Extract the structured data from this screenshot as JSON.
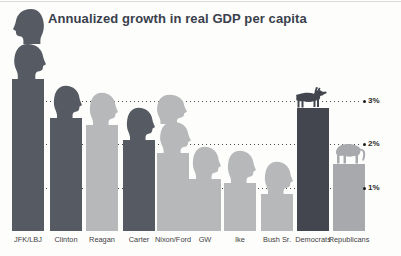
{
  "colors": {
    "dem_bar": "#565a63",
    "gop_bar": "#b6b8ba",
    "dem_strong": "#43464e",
    "gop_strong": "#a8a9ac",
    "title_text": "#39404b",
    "grid_dots": "#4a4a4a",
    "tick_text": "#2b2b2b",
    "axis_label_text": "#414141",
    "background": "#fdfdfc"
  },
  "chart_data": {
    "type": "bar",
    "title": "Annualized growth in real GDP per capita",
    "xlabel": "",
    "ylabel": "",
    "unit": "percent",
    "ylim": [
      0,
      3.6
    ],
    "grid": "dotted horizontal lines at 1%, 2%, 3%",
    "legend_position": "none",
    "gridlines": [
      {
        "label": "3%",
        "value": 3
      },
      {
        "label": "2%",
        "value": 2
      },
      {
        "label": "1%",
        "value": 1
      }
    ],
    "categories": [
      "JFK/LBJ",
      "Clinton",
      "Reagan",
      "Carter",
      "Nixon/Ford",
      "GW",
      "Ike",
      "Bush Sr.",
      "Democrats",
      "Republicans"
    ],
    "values": [
      3.5,
      2.6,
      2.45,
      2.1,
      1.8,
      1.2,
      1.1,
      0.85,
      2.85,
      1.55
    ],
    "bars": [
      {
        "label": "JFK/LBJ",
        "value": 3.5,
        "party": "Democrat",
        "color_key": "dem_bar",
        "icon": "double-head-tall"
      },
      {
        "label": "Clinton",
        "value": 2.6,
        "party": "Democrat",
        "color_key": "dem_bar",
        "icon": "head"
      },
      {
        "label": "Reagan",
        "value": 2.45,
        "party": "Republican",
        "color_key": "gop_bar",
        "icon": "head"
      },
      {
        "label": "Carter",
        "value": 2.1,
        "party": "Democrat",
        "color_key": "dem_bar",
        "icon": "head"
      },
      {
        "label": "Nixon/Ford",
        "value": 1.8,
        "party": "Republican",
        "color_key": "gop_bar",
        "icon": "double-head"
      },
      {
        "label": "GW",
        "value": 1.2,
        "party": "Republican",
        "color_key": "gop_bar",
        "icon": "head"
      },
      {
        "label": "Ike",
        "value": 1.1,
        "party": "Republican",
        "color_key": "gop_bar",
        "icon": "head"
      },
      {
        "label": "Bush Sr.",
        "value": 0.85,
        "party": "Republican",
        "color_key": "gop_bar",
        "icon": "head"
      },
      {
        "label": "Democrats",
        "value": 2.85,
        "party": "Democrat average",
        "color_key": "dem_strong",
        "icon": "donkey"
      },
      {
        "label": "Republicans",
        "value": 1.55,
        "party": "Republican average",
        "color_key": "gop_strong",
        "icon": "elephant"
      }
    ]
  }
}
